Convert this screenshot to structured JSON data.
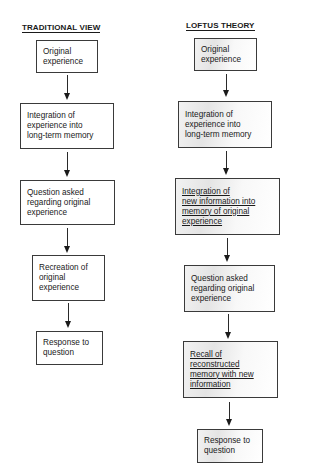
{
  "traditional": {
    "title": "TRADITIONAL VIEW",
    "steps": [
      {
        "lines": [
          "Original",
          "experience"
        ]
      },
      {
        "lines": [
          "Integration of",
          "experience into",
          "long-term memory"
        ]
      },
      {
        "lines": [
          "Question asked",
          "regarding original",
          "experience"
        ]
      },
      {
        "lines": [
          "Recreation of",
          "original",
          "experience"
        ]
      },
      {
        "lines": [
          "Response to",
          "question"
        ]
      }
    ]
  },
  "loftus": {
    "title": "LOFTUS THEORY",
    "steps": [
      {
        "lines": [
          "Original",
          "experience"
        ]
      },
      {
        "lines": [
          "Integration of",
          "experience into",
          "long-term memory"
        ]
      },
      {
        "lines": [
          "Integration of",
          "new information into",
          "memory of original",
          "experience"
        ],
        "underlined": true
      },
      {
        "lines": [
          "Question asked",
          "regarding original",
          "experience"
        ]
      },
      {
        "lines": [
          "Recall of",
          "reconstructed",
          "memory with new",
          "information"
        ],
        "underlined": true
      },
      {
        "lines": [
          "Response to",
          "question"
        ]
      }
    ]
  }
}
